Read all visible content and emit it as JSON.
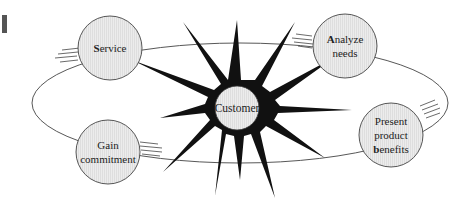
{
  "diagram": {
    "type": "cycle",
    "center": {
      "label": "Customer"
    },
    "nodes": [
      {
        "id": "service",
        "lines": [
          "Service"
        ],
        "initial": "S"
      },
      {
        "id": "analyze-needs",
        "lines": [
          "Analyze",
          "needs"
        ],
        "initial": "A"
      },
      {
        "id": "present-product-benefits",
        "lines": [
          "Present",
          "product",
          "benefits"
        ],
        "initial": "b"
      },
      {
        "id": "gain-commitment",
        "lines": [
          "Gain",
          "commitment"
        ],
        "initial": ""
      }
    ],
    "flow_order": [
      "Service",
      "Analyze needs",
      "Present product benefits",
      "Gain commitment"
    ],
    "colors": {
      "node_fill": "#e6e6e6",
      "stroke": "#333333",
      "burst": "#111111",
      "marker": "#555555"
    }
  },
  "labels": {
    "center": "Customer",
    "service_rest": "ervice",
    "service_initial": "S",
    "analyze_initial": "A",
    "analyze_rest": "nalyze",
    "analyze_line2": "needs",
    "present_line1": "Present",
    "present_line2": "product",
    "present_initial": "b",
    "present_rest": "enefits",
    "gain_line1": "Gain",
    "gain_line2": "commitment"
  }
}
